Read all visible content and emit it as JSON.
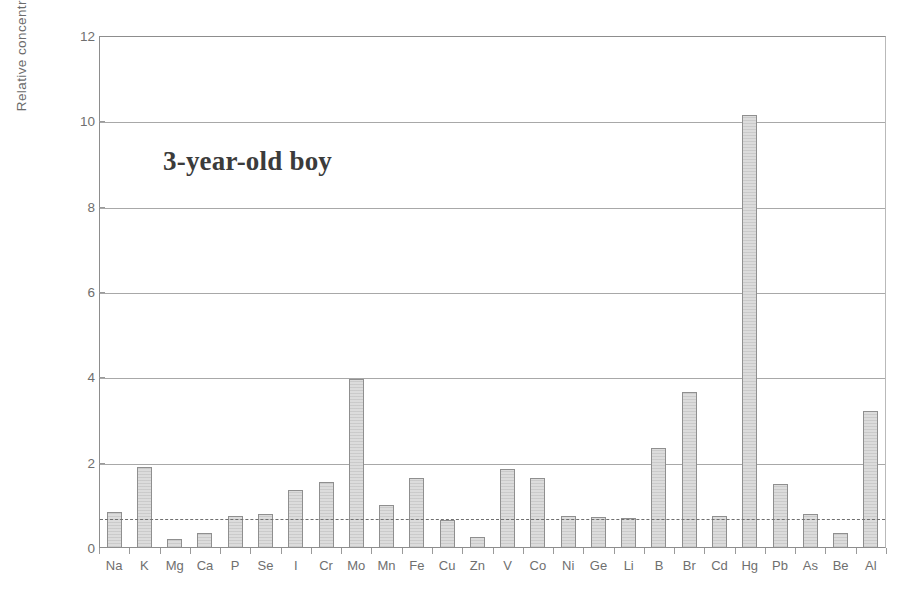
{
  "chart_data": {
    "type": "bar",
    "title": "",
    "annotation": "3-year-old boy",
    "xlabel": "",
    "ylabel": "Relative concentration",
    "ylim": [
      0,
      12
    ],
    "yticks": [
      0,
      2,
      4,
      6,
      8,
      10,
      12
    ],
    "grid": true,
    "legend": "none",
    "reference_line": {
      "value": 0.7,
      "style": "dashed",
      "label": ""
    },
    "categories": [
      "Na",
      "K",
      "Mg",
      "Ca",
      "P",
      "Se",
      "I",
      "Cr",
      "Mo",
      "Mn",
      "Fe",
      "Cu",
      "Zn",
      "V",
      "Co",
      "Ni",
      "Ge",
      "Li",
      "B",
      "Br",
      "Cd",
      "Hg",
      "Pb",
      "As",
      "Be",
      "Al"
    ],
    "values": [
      0.85,
      1.9,
      0.2,
      0.35,
      0.75,
      0.8,
      1.35,
      1.55,
      3.95,
      1.0,
      1.65,
      0.65,
      0.25,
      1.85,
      1.65,
      0.75,
      0.72,
      0.7,
      2.35,
      3.65,
      0.75,
      10.15,
      1.5,
      0.8,
      0.35,
      3.2
    ],
    "bar_color": "#dcdcdc",
    "bar_edge_color": "#8f8f8f",
    "axis_color": "#8d8d8d"
  }
}
